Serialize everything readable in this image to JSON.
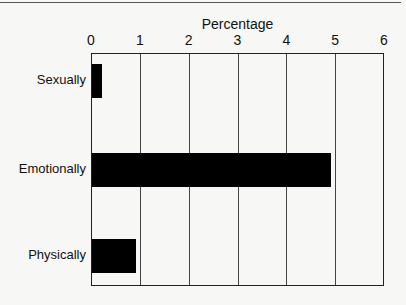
{
  "chart_data": {
    "type": "bar",
    "orientation": "horizontal",
    "title": "",
    "xlabel": "Percentage",
    "ylabel": "",
    "categories": [
      "Sexually",
      "Emotionally",
      "Physically"
    ],
    "values": [
      0.2,
      4.9,
      0.9
    ],
    "xlim": [
      0,
      6
    ],
    "xticks": [
      "0",
      "1",
      "2",
      "3",
      "4",
      "5",
      "6"
    ],
    "grid": "vertical gridlines at integer ticks",
    "legend": "none",
    "bar_color": "#000000"
  }
}
